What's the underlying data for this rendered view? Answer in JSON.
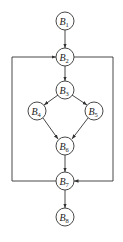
{
  "diagram": {
    "type": "control-flow-graph",
    "stroke_color": "#333333",
    "nodes": [
      {
        "id": "B1",
        "letter": "B",
        "sub": "1",
        "cx": 65,
        "cy": 21
      },
      {
        "id": "B2",
        "letter": "B",
        "sub": "2",
        "cx": 65,
        "cy": 57
      },
      {
        "id": "B3",
        "letter": "B",
        "sub": "3",
        "cx": 65,
        "cy": 90
      },
      {
        "id": "B4",
        "letter": "B",
        "sub": "4",
        "cx": 37,
        "cy": 111
      },
      {
        "id": "B5",
        "letter": "B",
        "sub": "5",
        "cx": 94,
        "cy": 111
      },
      {
        "id": "B6",
        "letter": "B",
        "sub": "6",
        "cx": 65,
        "cy": 146
      },
      {
        "id": "B7",
        "letter": "B",
        "sub": "7",
        "cx": 65,
        "cy": 181
      },
      {
        "id": "B8",
        "letter": "B",
        "sub": "8",
        "cx": 65,
        "cy": 217
      }
    ],
    "edges": [
      {
        "from": "B1",
        "to": "B2"
      },
      {
        "from": "B2",
        "to": "B3"
      },
      {
        "from": "B3",
        "to": "B4"
      },
      {
        "from": "B3",
        "to": "B5"
      },
      {
        "from": "B4",
        "to": "B6"
      },
      {
        "from": "B5",
        "to": "B6"
      },
      {
        "from": "B6",
        "to": "B7"
      },
      {
        "from": "B7",
        "to": "B8"
      },
      {
        "from": "B7",
        "to": "B2",
        "route": "left-loop"
      },
      {
        "from": "B2",
        "to": "B7",
        "route": "right-loop"
      }
    ]
  }
}
